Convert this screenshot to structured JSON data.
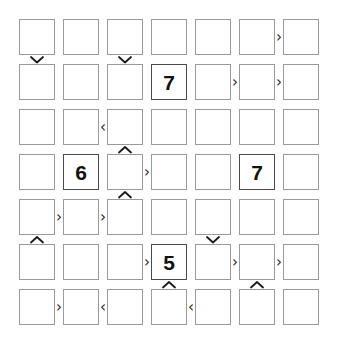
{
  "puzzle": {
    "type": "futoshiki",
    "size": 7,
    "rows": 7,
    "cols": 7,
    "background_color": "#ffffff",
    "cell_border_color": "#9a9a9a",
    "filled_cell_border_color": "#4a4a4a",
    "digit_color": "#111111",
    "constraint_color": "#1a1a1a",
    "cells": [
      [
        {
          "r": 1,
          "c": 1,
          "value": ""
        },
        {
          "r": 1,
          "c": 2,
          "value": ""
        },
        {
          "r": 1,
          "c": 3,
          "value": ""
        },
        {
          "r": 1,
          "c": 4,
          "value": ""
        },
        {
          "r": 1,
          "c": 5,
          "value": ""
        },
        {
          "r": 1,
          "c": 6,
          "value": ""
        },
        {
          "r": 1,
          "c": 7,
          "value": ""
        }
      ],
      [
        {
          "r": 2,
          "c": 1,
          "value": ""
        },
        {
          "r": 2,
          "c": 2,
          "value": ""
        },
        {
          "r": 2,
          "c": 3,
          "value": ""
        },
        {
          "r": 2,
          "c": 4,
          "value": "7"
        },
        {
          "r": 2,
          "c": 5,
          "value": ""
        },
        {
          "r": 2,
          "c": 6,
          "value": ""
        },
        {
          "r": 2,
          "c": 7,
          "value": ""
        }
      ],
      [
        {
          "r": 3,
          "c": 1,
          "value": ""
        },
        {
          "r": 3,
          "c": 2,
          "value": ""
        },
        {
          "r": 3,
          "c": 3,
          "value": ""
        },
        {
          "r": 3,
          "c": 4,
          "value": ""
        },
        {
          "r": 3,
          "c": 5,
          "value": ""
        },
        {
          "r": 3,
          "c": 6,
          "value": ""
        },
        {
          "r": 3,
          "c": 7,
          "value": ""
        }
      ],
      [
        {
          "r": 4,
          "c": 1,
          "value": ""
        },
        {
          "r": 4,
          "c": 2,
          "value": "6"
        },
        {
          "r": 4,
          "c": 3,
          "value": ""
        },
        {
          "r": 4,
          "c": 4,
          "value": ""
        },
        {
          "r": 4,
          "c": 5,
          "value": ""
        },
        {
          "r": 4,
          "c": 6,
          "value": "7"
        },
        {
          "r": 4,
          "c": 7,
          "value": ""
        }
      ],
      [
        {
          "r": 5,
          "c": 1,
          "value": ""
        },
        {
          "r": 5,
          "c": 2,
          "value": ""
        },
        {
          "r": 5,
          "c": 3,
          "value": ""
        },
        {
          "r": 5,
          "c": 4,
          "value": ""
        },
        {
          "r": 5,
          "c": 5,
          "value": ""
        },
        {
          "r": 5,
          "c": 6,
          "value": ""
        },
        {
          "r": 5,
          "c": 7,
          "value": ""
        }
      ],
      [
        {
          "r": 6,
          "c": 1,
          "value": ""
        },
        {
          "r": 6,
          "c": 2,
          "value": ""
        },
        {
          "r": 6,
          "c": 3,
          "value": ""
        },
        {
          "r": 6,
          "c": 4,
          "value": "5"
        },
        {
          "r": 6,
          "c": 5,
          "value": ""
        },
        {
          "r": 6,
          "c": 6,
          "value": ""
        },
        {
          "r": 6,
          "c": 7,
          "value": ""
        }
      ],
      [
        {
          "r": 7,
          "c": 1,
          "value": ""
        },
        {
          "r": 7,
          "c": 2,
          "value": ""
        },
        {
          "r": 7,
          "c": 3,
          "value": ""
        },
        {
          "r": 7,
          "c": 4,
          "value": ""
        },
        {
          "r": 7,
          "c": 5,
          "value": ""
        },
        {
          "r": 7,
          "c": 6,
          "value": ""
        },
        {
          "r": 7,
          "c": 7,
          "value": ""
        }
      ]
    ],
    "horizontal_constraints": [
      {
        "row": 1,
        "left_col": 6,
        "right_col": 7,
        "symbol": "›",
        "relation": "greater-than"
      },
      {
        "row": 2,
        "left_col": 5,
        "right_col": 6,
        "symbol": "›",
        "relation": "greater-than"
      },
      {
        "row": 2,
        "left_col": 6,
        "right_col": 7,
        "symbol": "›",
        "relation": "greater-than"
      },
      {
        "row": 3,
        "left_col": 2,
        "right_col": 3,
        "symbol": "‹",
        "relation": "less-than"
      },
      {
        "row": 4,
        "left_col": 3,
        "right_col": 4,
        "symbol": "›",
        "relation": "greater-than"
      },
      {
        "row": 5,
        "left_col": 1,
        "right_col": 2,
        "symbol": "›",
        "relation": "greater-than"
      },
      {
        "row": 5,
        "left_col": 2,
        "right_col": 3,
        "symbol": "›",
        "relation": "greater-than"
      },
      {
        "row": 6,
        "left_col": 3,
        "right_col": 4,
        "symbol": "›",
        "relation": "greater-than"
      },
      {
        "row": 6,
        "left_col": 5,
        "right_col": 6,
        "symbol": "›",
        "relation": "greater-than"
      },
      {
        "row": 6,
        "left_col": 6,
        "right_col": 7,
        "symbol": "›",
        "relation": "greater-than"
      },
      {
        "row": 7,
        "left_col": 1,
        "right_col": 2,
        "symbol": "›",
        "relation": "greater-than"
      },
      {
        "row": 7,
        "left_col": 2,
        "right_col": 3,
        "symbol": "‹",
        "relation": "less-than"
      },
      {
        "row": 7,
        "left_col": 4,
        "right_col": 5,
        "symbol": "‹",
        "relation": "less-than"
      }
    ],
    "vertical_constraints": [
      {
        "col": 1,
        "top_row": 1,
        "bottom_row": 2,
        "direction": "down",
        "relation": "greater-than"
      },
      {
        "col": 3,
        "top_row": 1,
        "bottom_row": 2,
        "direction": "down",
        "relation": "greater-than"
      },
      {
        "col": 3,
        "top_row": 3,
        "bottom_row": 4,
        "direction": "up",
        "relation": "less-than"
      },
      {
        "col": 3,
        "top_row": 4,
        "bottom_row": 5,
        "direction": "up",
        "relation": "less-than"
      },
      {
        "col": 1,
        "top_row": 5,
        "bottom_row": 6,
        "direction": "up",
        "relation": "less-than"
      },
      {
        "col": 5,
        "top_row": 5,
        "bottom_row": 6,
        "direction": "down",
        "relation": "greater-than"
      },
      {
        "col": 4,
        "top_row": 6,
        "bottom_row": 7,
        "direction": "up",
        "relation": "less-than"
      },
      {
        "col": 6,
        "top_row": 6,
        "bottom_row": 7,
        "direction": "up",
        "relation": "less-than"
      }
    ]
  },
  "geometry": {
    "origin_x": 19,
    "origin_y": 19,
    "cell_size": 36,
    "col_pitch": 44,
    "row_pitch": 45
  }
}
